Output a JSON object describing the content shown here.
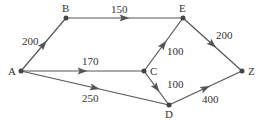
{
  "nodes": [
    {
      "id": "A",
      "label": "A",
      "x": 21,
      "y": 71,
      "lx": 8,
      "ly": 75
    },
    {
      "id": "B",
      "label": "B",
      "x": 66,
      "y": 18,
      "lx": 62,
      "ly": 12
    },
    {
      "id": "E",
      "label": "E",
      "x": 183,
      "y": 18,
      "lx": 179,
      "ly": 12
    },
    {
      "id": "C",
      "label": "C",
      "x": 144,
      "y": 71,
      "lx": 150,
      "ly": 75
    },
    {
      "id": "D",
      "label": "D",
      "x": 169,
      "y": 105,
      "lx": 165,
      "ly": 118
    },
    {
      "id": "Z",
      "label": "Z",
      "x": 242,
      "y": 71,
      "lx": 248,
      "ly": 75
    }
  ],
  "edges": [
    {
      "from": "A",
      "to": "B",
      "weight": "200",
      "lx": 22,
      "ly": 45
    },
    {
      "from": "B",
      "to": "E",
      "weight": "150",
      "lx": 111,
      "ly": 13
    },
    {
      "from": "A",
      "to": "C",
      "weight": "170",
      "lx": 82,
      "ly": 65
    },
    {
      "from": "A",
      "to": "D",
      "weight": "250",
      "lx": 82,
      "ly": 102
    },
    {
      "from": "C",
      "to": "E",
      "weight": "100",
      "lx": 167,
      "ly": 55
    },
    {
      "from": "C",
      "to": "D",
      "weight": "100",
      "lx": 167,
      "ly": 88
    },
    {
      "from": "E",
      "to": "Z",
      "weight": "200",
      "lx": 216,
      "ly": 39
    },
    {
      "from": "D",
      "to": "Z",
      "weight": "400",
      "lx": 202,
      "ly": 103
    }
  ],
  "colors": {
    "line": "#555555",
    "node": "#444444",
    "text": "#333333"
  }
}
